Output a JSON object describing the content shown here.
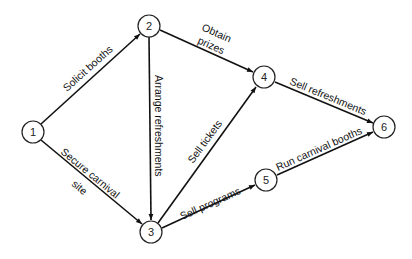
{
  "diagram": {
    "type": "activity-network",
    "nodes": [
      {
        "id": "1",
        "label": "1",
        "x": 33,
        "y": 132
      },
      {
        "id": "2",
        "label": "2",
        "x": 149,
        "y": 26
      },
      {
        "id": "3",
        "label": "3",
        "x": 151,
        "y": 232
      },
      {
        "id": "4",
        "label": "4",
        "x": 264,
        "y": 77
      },
      {
        "id": "5",
        "label": "5",
        "x": 266,
        "y": 180
      },
      {
        "id": "6",
        "label": "6",
        "x": 384,
        "y": 127
      }
    ],
    "edges": [
      {
        "from": "1",
        "to": "2",
        "label": "Solicit booths"
      },
      {
        "from": "1",
        "to": "3",
        "label_line1": "Secure carnival",
        "label_line2": "site"
      },
      {
        "from": "2",
        "to": "3",
        "label": "Arrange refreshments"
      },
      {
        "from": "2",
        "to": "4",
        "label_line1": "Obtain",
        "label_line2": "prizes"
      },
      {
        "from": "3",
        "to": "4",
        "label": "Sell tickets"
      },
      {
        "from": "3",
        "to": "5",
        "label": "Sell programs"
      },
      {
        "from": "4",
        "to": "6",
        "label": "Sell refreshments"
      },
      {
        "from": "5",
        "to": "6",
        "label": "Run carnival booths"
      }
    ]
  }
}
